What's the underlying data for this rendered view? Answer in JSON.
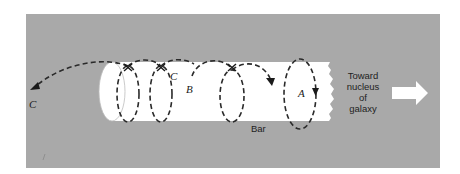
{
  "figure": {
    "background_color": "#a9a9a9",
    "bar_color": "#ffffff",
    "orbit_color": "#2a2a2a",
    "labels": {
      "c_outer": "C",
      "c_inner": "C",
      "b": "B",
      "a": "A",
      "bar": "Bar",
      "direction_line1": "Toward",
      "direction_line2": "nucleus",
      "direction_line3": "of",
      "direction_line4": "galaxy"
    },
    "orbits": [
      {
        "name": "A",
        "description": "closed loop orbit around bar near nucleus end"
      },
      {
        "name": "B",
        "description": "looping orbit advancing along bar"
      },
      {
        "name": "C",
        "description": "helical orbit escaping bar end"
      }
    ],
    "arrow_icon": "right-arrow"
  }
}
